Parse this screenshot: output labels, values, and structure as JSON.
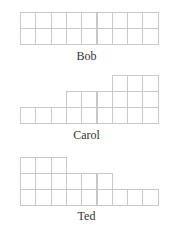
{
  "diagrams": [
    {
      "name": "Bob",
      "heights": [
        2,
        2,
        2,
        2,
        2,
        2,
        2,
        2,
        2
      ],
      "base_y": 44,
      "label_y": 49
    },
    {
      "name": "Carol",
      "heights": [
        1,
        1,
        1,
        2,
        2,
        2,
        3,
        3,
        3
      ],
      "base_y": 123,
      "label_y": 128
    },
    {
      "name": "Ted",
      "heights": [
        3,
        3,
        3,
        2,
        2,
        2,
        1,
        1,
        1
      ],
      "base_y": 205,
      "label_y": 209
    }
  ],
  "layout": {
    "left": 20,
    "cell_w": 15.3,
    "cell_h": 16,
    "grid_color": "#c8c8c8"
  }
}
